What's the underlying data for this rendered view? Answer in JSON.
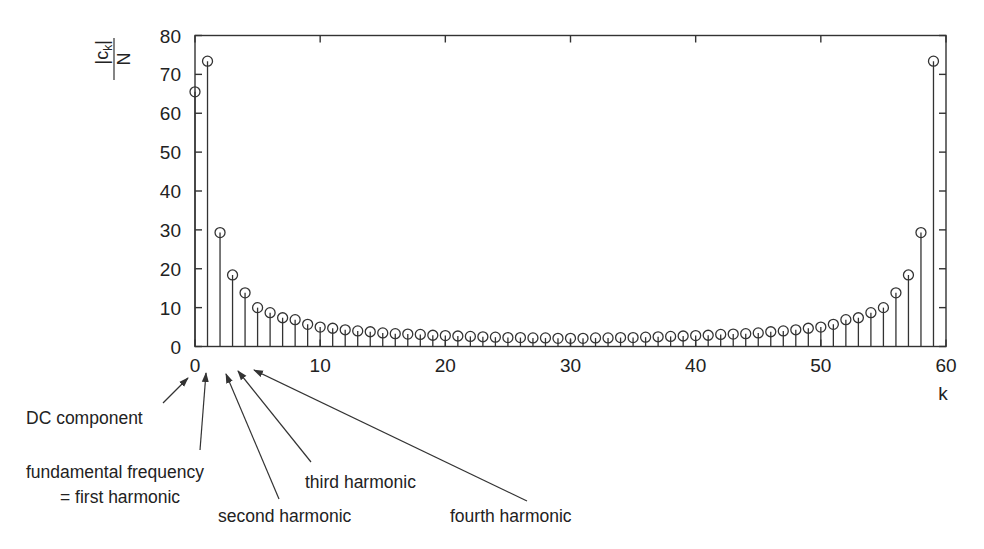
{
  "chart_data": {
    "type": "stem",
    "title": "",
    "xlabel": "k",
    "ylabel": "|c_k| / N",
    "ylabel_parts": {
      "numerator": "|c",
      "subscript": "k",
      "numerator_end": "|",
      "denominator": "N"
    },
    "xlim": [
      0,
      60
    ],
    "ylim": [
      0,
      80
    ],
    "xticks": [
      0,
      10,
      20,
      30,
      40,
      50,
      60
    ],
    "yticks": [
      0,
      10,
      20,
      30,
      40,
      50,
      60,
      70,
      80
    ],
    "grid": false,
    "legend": null,
    "marker": "open-circle",
    "x": [
      0,
      1,
      2,
      3,
      4,
      5,
      6,
      7,
      8,
      9,
      10,
      11,
      12,
      13,
      14,
      15,
      16,
      17,
      18,
      19,
      20,
      21,
      22,
      23,
      24,
      25,
      26,
      27,
      28,
      29,
      30,
      31,
      32,
      33,
      34,
      35,
      36,
      37,
      38,
      39,
      40,
      41,
      42,
      43,
      44,
      45,
      46,
      47,
      48,
      49,
      50,
      51,
      52,
      53,
      54,
      55,
      56,
      57,
      58,
      59
    ],
    "values": [
      65.5,
      73.4,
      29.3,
      18.4,
      13.8,
      10.0,
      8.7,
      7.4,
      6.9,
      5.7,
      5.0,
      4.7,
      4.3,
      4.0,
      3.8,
      3.5,
      3.3,
      3.2,
      3.1,
      2.9,
      2.8,
      2.7,
      2.6,
      2.5,
      2.4,
      2.3,
      2.3,
      2.2,
      2.2,
      2.1,
      2.1,
      2.1,
      2.2,
      2.2,
      2.3,
      2.3,
      2.4,
      2.5,
      2.6,
      2.7,
      2.8,
      2.9,
      3.1,
      3.2,
      3.3,
      3.5,
      3.8,
      4.0,
      4.3,
      4.7,
      5.0,
      5.7,
      6.9,
      7.4,
      8.7,
      10.0,
      13.8,
      18.4,
      29.3,
      73.4
    ],
    "annotations": [
      {
        "id": "dc",
        "text": "DC component",
        "points_to_k": 0
      },
      {
        "id": "fundamental",
        "text": "fundamental frequency",
        "text2": "= first harmonic",
        "points_to_k": 1
      },
      {
        "id": "second",
        "text": "second harmonic",
        "points_to_k": 2
      },
      {
        "id": "third",
        "text": "third harmonic",
        "points_to_k": 3
      },
      {
        "id": "fourth",
        "text": "fourth harmonic",
        "points_to_k": 4
      }
    ]
  },
  "colors": {
    "ink": "#333333",
    "text": "#222222",
    "background": "#ffffff"
  }
}
